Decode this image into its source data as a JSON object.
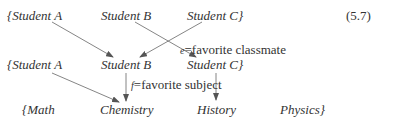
{
  "equation_number": "(5.7)",
  "rows": {
    "top": [
      "{Student A",
      "Student B",
      "Student C}"
    ],
    "middle": [
      "{Student A",
      "Student B",
      "Student C}"
    ],
    "bottom": [
      "{Math",
      "Chemistry",
      "History",
      "Physics}"
    ]
  },
  "maps": {
    "e": {
      "var": "e",
      "eq": "=",
      "label": "favorite classmate"
    },
    "f": {
      "var": "f",
      "eq": "=",
      "label": "favorite subject"
    }
  },
  "edges": {
    "e": [
      {
        "from": "top.Student A",
        "to": "middle.Student B"
      },
      {
        "from": "top.Student B",
        "to": "middle.Student C"
      },
      {
        "from": "top.Student C",
        "to": "middle.Student B"
      }
    ],
    "f": [
      {
        "from": "middle.Student A",
        "to": "bottom.Chemistry"
      },
      {
        "from": "middle.Student B",
        "to": "bottom.Chemistry"
      },
      {
        "from": "middle.Student C",
        "to": "bottom.History"
      }
    ]
  },
  "colors": {
    "text": "#333333",
    "arrow": "#555555"
  }
}
